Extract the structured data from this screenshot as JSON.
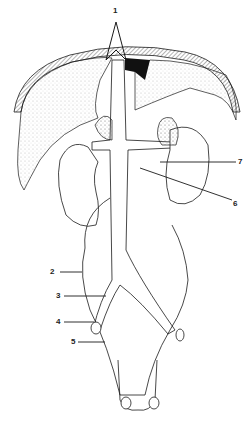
{
  "figure": {
    "ink_color": "#1a1a1a",
    "background": "#ffffff",
    "labels": [
      {
        "id": "1",
        "text": "1"
      },
      {
        "id": "2",
        "text": "2"
      },
      {
        "id": "3",
        "text": "3"
      },
      {
        "id": "4",
        "text": "4"
      },
      {
        "id": "5",
        "text": "5"
      },
      {
        "id": "6",
        "text": "6"
      },
      {
        "id": "7",
        "text": "7"
      }
    ]
  }
}
